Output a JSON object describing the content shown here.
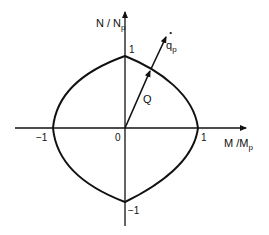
{
  "diagram": {
    "axes": {
      "y_label_main": "N / N",
      "y_label_sub": "p",
      "x_label_main": "M /M",
      "x_label_sub": "p"
    },
    "ticks": {
      "top": "1",
      "bottom": "−1",
      "left": "−1",
      "right": "1",
      "origin": "0"
    },
    "vectors": {
      "load_label": "Q",
      "flow_label_main": "q",
      "flow_label_sub": "p",
      "flow_dot": "·"
    },
    "colors": {
      "stroke": "#111111",
      "background": "#ffffff"
    }
  }
}
